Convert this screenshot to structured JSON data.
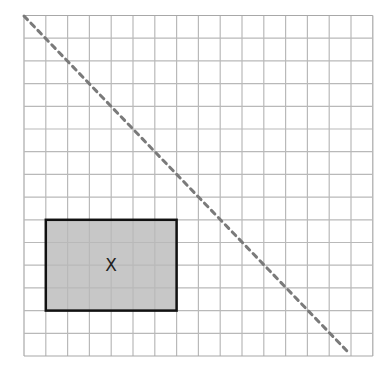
{
  "diagram": {
    "type": "grid-diagram",
    "grid": {
      "columns": 16,
      "rows": 15,
      "left": 24,
      "top": 15.5,
      "cell_width": 21.8,
      "cell_height": 22.7,
      "line_color": "#b9b9b9",
      "border_color": "#a8a8a8"
    },
    "diagonal": {
      "style": "dashed",
      "color": "#7a7a7a",
      "x1": 24,
      "y1": 16,
      "x2": 347,
      "y2": 351
    },
    "rectangle": {
      "col_start": 1,
      "col_end": 7,
      "row_start": 9,
      "row_end": 13,
      "fill": "#c7c7c7",
      "stroke": "#111111",
      "label": "X"
    }
  }
}
